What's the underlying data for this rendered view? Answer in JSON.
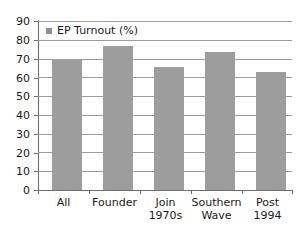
{
  "chart_data": {
    "type": "bar",
    "title": "",
    "subtitle": "",
    "xlabel": "",
    "ylabel": "",
    "categories": [
      "All",
      "Founder",
      "Join 1970s",
      "Southern Wave",
      "Post 1994"
    ],
    "category_lines": [
      [
        "All",
        ""
      ],
      [
        "Founder",
        ""
      ],
      [
        "Join",
        "1970s"
      ],
      [
        "Southern",
        "Wave"
      ],
      [
        "Post",
        "1994"
      ]
    ],
    "series": [
      {
        "name": "EP Turnout (%)",
        "values": [
          70,
          76.5,
          65.5,
          73.5,
          63
        ]
      }
    ],
    "values": [
      70,
      76.5,
      65.5,
      73.5,
      63
    ],
    "ylim": [
      0,
      90
    ],
    "ytick_step": 10,
    "ytick_labels": [
      "90",
      "80",
      "70",
      "60",
      "50",
      "40",
      "30",
      "20",
      "10",
      "0"
    ],
    "ytick_values": [
      90,
      80,
      70,
      60,
      50,
      40,
      30,
      20,
      10,
      0
    ],
    "grid": true,
    "grid_axis": "y",
    "legend": {
      "position": "top-left-inside",
      "entries": [
        {
          "label": "EP Turnout (%)",
          "marker": "legend-swatch-icon",
          "color": "#8f8f8f"
        }
      ]
    },
    "colors": {
      "bar": "#9d9d9d",
      "gridline": "#9b9b9b",
      "axis": "#6e6e6e",
      "text": "#1a1a1a",
      "background": "#ffffff"
    }
  }
}
